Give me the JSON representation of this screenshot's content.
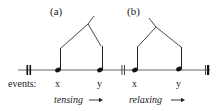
{
  "diagram": {
    "panels": [
      {
        "id": "a",
        "label": "(a)",
        "process": "tensing",
        "arrow": "→"
      },
      {
        "id": "b",
        "label": "(b)",
        "process": "relaxing",
        "arrow": "→"
      }
    ],
    "events_label": "events:",
    "event_names": [
      "x",
      "y",
      "x",
      "y"
    ],
    "colors": {
      "line": "#555555",
      "ink": "#111111",
      "background": "#ffffff"
    }
  }
}
